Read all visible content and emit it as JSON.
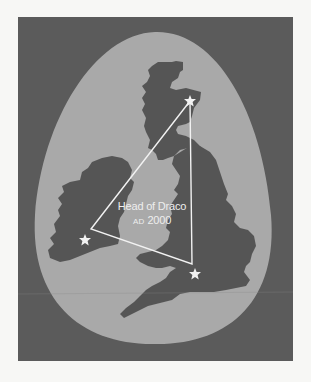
{
  "map": {
    "title": "Head of Draco",
    "era": "AD",
    "year": "2000",
    "colors": {
      "page_background": "#f7f7f5",
      "frame": "#5b5b5b",
      "egg_region": "#a9a9a9",
      "land": "#555555",
      "lines_and_stars": "#f2f2f2"
    },
    "regions": [
      "Ireland",
      "Scotland",
      "England & Wales"
    ],
    "markers": [
      {
        "name": "star-north",
        "icon": "star-icon",
        "x": 190,
        "y": 101
      },
      {
        "name": "star-west",
        "icon": "star-icon",
        "x": 85,
        "y": 240
      },
      {
        "name": "star-south",
        "icon": "star-icon",
        "x": 195,
        "y": 274
      }
    ],
    "triangle": {
      "vertices": [
        [
          190,
          101
        ],
        [
          91,
          229
        ],
        [
          192,
          264
        ]
      ]
    }
  }
}
